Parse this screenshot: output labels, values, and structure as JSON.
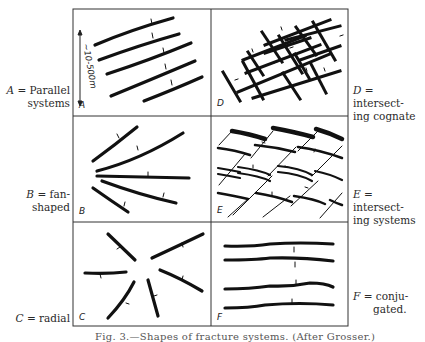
{
  "figure": {
    "caption": "Fig. 3.—Shapes of fracture systems. (After Grosser.)",
    "scale_annotation": "~10-500m",
    "stroke_color": "#111111",
    "frame_color": "#333333"
  },
  "panels": [
    {
      "letter": "A",
      "label_prefix": "A",
      "label_text": "= Parallel",
      "label_text2": "systems",
      "description": "Parallel systems"
    },
    {
      "letter": "B",
      "label_prefix": "B",
      "label_text": "= fan-",
      "label_text2": "shaped",
      "description": "fan-shaped"
    },
    {
      "letter": "C",
      "label_prefix": "C",
      "label_text": "= radial",
      "label_text2": "",
      "description": "radial"
    },
    {
      "letter": "D",
      "label_prefix": "D",
      "label_text": "= intersect-",
      "label_text2": "ing cognate",
      "description": "intersecting cognate"
    },
    {
      "letter": "E",
      "label_prefix": "E",
      "label_text": "= intersect-",
      "label_text2": "ing systems",
      "description": "intersecting systems"
    },
    {
      "letter": "F",
      "label_prefix": "F",
      "label_text": "= conju-",
      "label_text2": "gated.",
      "description": "conjugated"
    }
  ]
}
